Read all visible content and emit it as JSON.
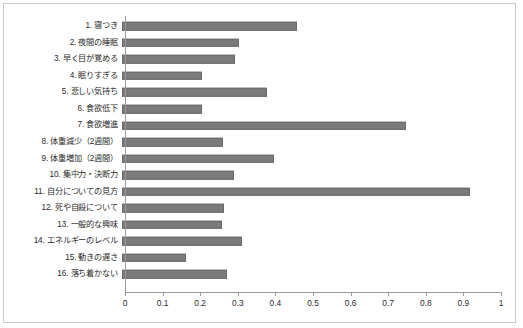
{
  "chart": {
    "title": "",
    "background_color": "#ffffff",
    "border_color": "#c9c9c9",
    "bar_color": "#7b7b7b",
    "axis_color": "#9a9a9a"
  },
  "chart_data": {
    "type": "bar",
    "orientation": "horizontal",
    "title": "",
    "xlabel": "",
    "ylabel": "",
    "xlim": [
      0,
      1
    ],
    "ylim": null,
    "grid": false,
    "legend": null,
    "xticks": [
      "0",
      "0.1",
      "0.2",
      "0.3",
      "0.4",
      "0.5",
      "0.6",
      "0.7",
      "0.8",
      "0.9",
      "1"
    ],
    "xtick_values": [
      0,
      0.1,
      0.2,
      0.3,
      0.4,
      0.5,
      0.6,
      0.7,
      0.8,
      0.9,
      1
    ],
    "categories": [
      "1. 寝つき",
      "2. 夜間の睡眠",
      "3. 早く目が覚める",
      "4. 眠りすぎる",
      "5. 悲しい気持ち",
      "6. 食欲低下",
      "7. 食欲増進",
      "8. 体重減少（2週間）",
      "9. 体重増加（2週間）",
      "10. 集中力・決断力",
      "11. 自分についての見方",
      "12. 死や自殺について",
      "13. 一般的な興味",
      "14. エネルギーのレベル",
      "15. 動きの遅さ",
      "16. 落ち着かない"
    ],
    "values": [
      0.465,
      0.31,
      0.3,
      0.212,
      0.385,
      0.212,
      0.755,
      0.268,
      0.405,
      0.298,
      0.925,
      0.27,
      0.265,
      0.318,
      0.17,
      0.28
    ]
  }
}
